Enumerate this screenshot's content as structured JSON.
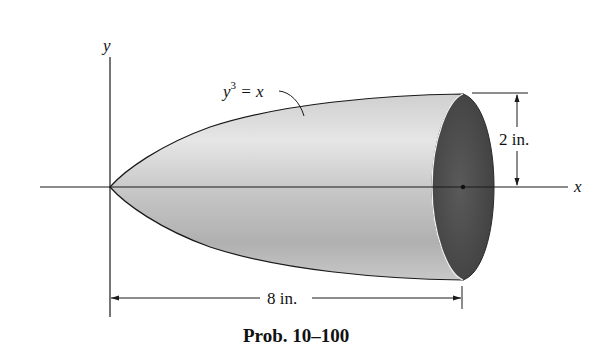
{
  "figure": {
    "caption": "Prob. 10–100",
    "axes": {
      "x_label": "x",
      "y_label": "y"
    },
    "curve": {
      "equation_base": "y",
      "equation_exponent": "3",
      "equation_rest": " = x"
    },
    "dimensions": {
      "radius_label": "2 in.",
      "length_label": "8 in."
    },
    "colors": {
      "line": "#1a1a1a",
      "surface_light": "#e2e2e2",
      "surface_mid": "#bdbdbd",
      "end_face": "#4a4a4a"
    }
  }
}
